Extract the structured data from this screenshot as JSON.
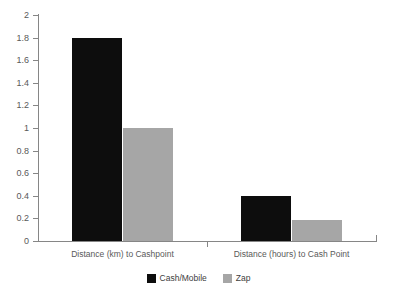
{
  "chart_data": {
    "type": "bar",
    "title": "",
    "subtitle": "",
    "xlabel": "",
    "ylabel": "",
    "categories": [
      "Distance (km) to Cashpoint",
      "Distance (hours) to Cash Point"
    ],
    "series": [
      {
        "name": "Cash/Mobile",
        "color": "#0d0d0d",
        "values": [
          1.8,
          0.4
        ]
      },
      {
        "name": "Zap",
        "color": "#a6a6a6",
        "values": [
          1.0,
          0.19
        ]
      }
    ],
    "ylim": [
      0,
      2
    ],
    "ytick_step": 0.2,
    "ytick_labels": [
      "0",
      "0.2",
      "0.4",
      "0.6",
      "0.8",
      "1",
      "1.2",
      "1.4",
      "1.6",
      "1.8",
      "2"
    ],
    "ytick_values": [
      0,
      0.2,
      0.4,
      0.6,
      0.8,
      1,
      1.2,
      1.4,
      1.6,
      1.8,
      2
    ],
    "grid": false,
    "legend_position": "bottom",
    "axis_color": "#868686",
    "tick_label_color": "#595959",
    "background": "#ffffff"
  }
}
